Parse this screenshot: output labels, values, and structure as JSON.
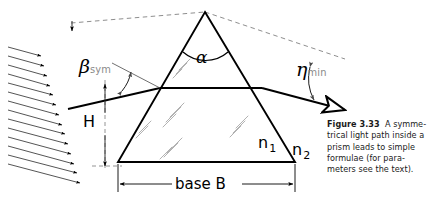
{
  "figure": {
    "caption": {
      "label": "Figure 3.33",
      "lines": [
        "A symme-",
        "trical light path inside a",
        "prism leads to simple",
        "formulae (for para-",
        "meters see the text)."
      ]
    },
    "labels": {
      "apex_angle": "α",
      "incidence_angle": "β",
      "incidence_angle_sub": "sym",
      "deviation_angle": "η",
      "deviation_angle_sub": "min",
      "height": "H",
      "index_inside": "n",
      "index_inside_sub": "1",
      "index_outside": "n",
      "index_outside_sub": "2",
      "base": "base  B"
    },
    "colors": {
      "ink": "#000000",
      "dash": "#7a7a7a",
      "sparkle": "#a8a8a8",
      "subscript": "#8a8a8a",
      "caption": "#1a1a1a"
    },
    "geometry": {
      "apex": [
        205,
        12
      ],
      "base_left": [
        118,
        162
      ],
      "base_right": [
        295,
        162
      ],
      "entry_point": [
        160,
        88
      ],
      "exit_point": [
        262,
        88
      ],
      "base_dim_y": 184,
      "height_dim_x": 105
    },
    "incoming_beam": {
      "name": "plane-wave-arrows",
      "count": 14
    }
  }
}
